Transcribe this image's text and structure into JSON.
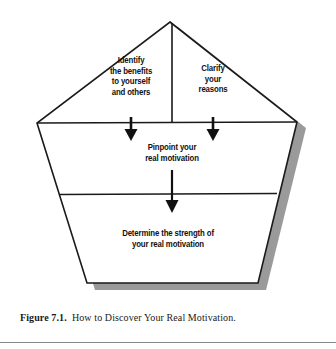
{
  "figure": {
    "caption_label": "Figure 7.1.",
    "caption_text": "How to Discover Your Real Motivation.",
    "colors": {
      "outline": "#1a1a1a",
      "shadow": "#9a9a9a",
      "fill": "#ffffff",
      "text": "#111111",
      "rule": "#8a8a8a"
    }
  },
  "diagram": {
    "type": "pentagon-flow",
    "shape": "pentagon",
    "cells": [
      {
        "id": "identify",
        "position": "top-left",
        "text": "Identify\nthe benefits\nto yourself\nand others"
      },
      {
        "id": "clarify",
        "position": "top-right",
        "text": "Clarify\nyour\nreasons"
      },
      {
        "id": "pinpoint",
        "position": "middle",
        "text": "Pinpoint your\nreal motivation"
      },
      {
        "id": "determine",
        "position": "bottom",
        "text": "Determine the strength of\nyour real motivation"
      }
    ],
    "arrows": [
      {
        "id": "arrow-identify-to-pinpoint",
        "from": "identify",
        "to": "pinpoint",
        "direction": "down"
      },
      {
        "id": "arrow-clarify-to-pinpoint",
        "from": "clarify",
        "to": "pinpoint",
        "direction": "down"
      },
      {
        "id": "arrow-pinpoint-to-determine",
        "from": "pinpoint",
        "to": "determine",
        "direction": "down"
      }
    ]
  }
}
